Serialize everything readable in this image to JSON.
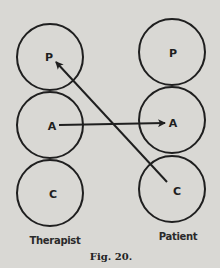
{
  "diagram": {
    "caption": "Fig. 20.",
    "columns": [
      {
        "label": "Therapist",
        "states": [
          {
            "label": "P",
            "name": "Parent"
          },
          {
            "label": "A",
            "name": "Adult"
          },
          {
            "label": "C",
            "name": "Child"
          }
        ]
      },
      {
        "label": "Patient",
        "states": [
          {
            "label": "P",
            "name": "Parent"
          },
          {
            "label": "A",
            "name": "Adult"
          },
          {
            "label": "C",
            "name": "Child"
          }
        ]
      }
    ],
    "arrows": [
      {
        "from": "Therapist A",
        "to": "Patient A"
      },
      {
        "from": "Patient C",
        "to": "Therapist P"
      }
    ],
    "colors": {
      "background": "#d9d8d4",
      "ink": "#1f1f1f"
    }
  }
}
